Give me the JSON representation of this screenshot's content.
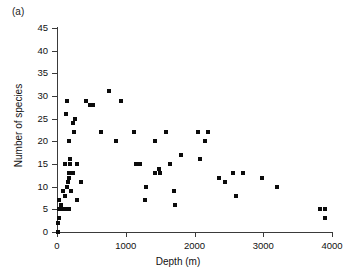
{
  "figure": {
    "panel_label": "(a)"
  },
  "chart_data": {
    "type": "scatter",
    "title": "",
    "xlabel": "Depth (m)",
    "ylabel": "Number of species",
    "xlim": [
      0,
      4000
    ],
    "ylim": [
      0,
      45
    ],
    "xticks": [
      0,
      1000,
      2000,
      3000,
      4000
    ],
    "yticks": [
      0,
      5,
      10,
      15,
      20,
      25,
      30,
      35,
      40,
      45
    ],
    "xtick_labels": [
      "0",
      "1000",
      "2000",
      "3000",
      "4000"
    ],
    "ytick_labels": [
      "0",
      "5",
      "10",
      "15",
      "20",
      "25",
      "30",
      "35",
      "40",
      "45"
    ],
    "grid": false,
    "legend": null,
    "marker": "square",
    "marker_color": "#0b0b0b",
    "points": [
      [
        10,
        0
      ],
      [
        20,
        2
      ],
      [
        25,
        3
      ],
      [
        35,
        5
      ],
      [
        60,
        5
      ],
      [
        80,
        5
      ],
      [
        110,
        5
      ],
      [
        130,
        5
      ],
      [
        150,
        5
      ],
      [
        175,
        5
      ],
      [
        60,
        6
      ],
      [
        30,
        7
      ],
      [
        290,
        7
      ],
      [
        110,
        8
      ],
      [
        80,
        9
      ],
      [
        205,
        9
      ],
      [
        1700,
        9
      ],
      [
        150,
        10
      ],
      [
        160,
        11
      ],
      [
        355,
        11
      ],
      [
        170,
        12
      ],
      [
        180,
        13
      ],
      [
        230,
        13
      ],
      [
        115,
        15
      ],
      [
        185,
        15
      ],
      [
        290,
        15
      ],
      [
        1480,
        14
      ],
      [
        195,
        16
      ],
      [
        1800,
        17
      ],
      [
        2080,
        16
      ],
      [
        180,
        20
      ],
      [
        860,
        20
      ],
      [
        1420,
        20
      ],
      [
        2150,
        20
      ],
      [
        250,
        22
      ],
      [
        640,
        22
      ],
      [
        1125,
        22
      ],
      [
        1580,
        22
      ],
      [
        2050,
        22
      ],
      [
        2200,
        22
      ],
      [
        230,
        24
      ],
      [
        255,
        25
      ],
      [
        130,
        26
      ],
      [
        150,
        29
      ],
      [
        420,
        29
      ],
      [
        480,
        28
      ],
      [
        530,
        28
      ],
      [
        760,
        31
      ],
      [
        930,
        29
      ],
      [
        1150,
        15
      ],
      [
        1200,
        15
      ],
      [
        1420,
        13
      ],
      [
        1500,
        13
      ],
      [
        1640,
        15
      ],
      [
        1300,
        10
      ],
      [
        1280,
        7
      ],
      [
        1720,
        6
      ],
      [
        2350,
        12
      ],
      [
        2450,
        11
      ],
      [
        2560,
        13
      ],
      [
        2700,
        13
      ],
      [
        2600,
        8
      ],
      [
        2980,
        12
      ],
      [
        3200,
        10
      ],
      [
        3820,
        5
      ],
      [
        3900,
        5
      ],
      [
        3900,
        3
      ]
    ]
  }
}
